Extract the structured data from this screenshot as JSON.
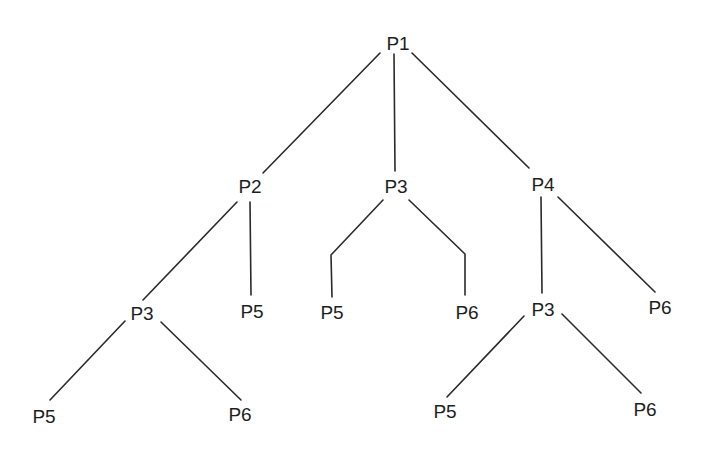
{
  "diagram": {
    "type": "tree",
    "background": "#ffffff",
    "line_color": "#2a2a2a",
    "text_color": "#1e1e1e",
    "nodes": [
      {
        "id": "n1",
        "label": "P1",
        "x": 398,
        "y": 50,
        "parent": null
      },
      {
        "id": "n2",
        "label": "P2",
        "x": 250,
        "y": 193,
        "parent": "n1"
      },
      {
        "id": "n3",
        "label": "P3",
        "x": 396,
        "y": 193,
        "parent": "n1"
      },
      {
        "id": "n4",
        "label": "P4",
        "x": 543,
        "y": 191,
        "parent": "n1"
      },
      {
        "id": "n5",
        "label": "P3",
        "x": 142,
        "y": 320,
        "parent": "n2"
      },
      {
        "id": "n6",
        "label": "P5",
        "x": 252,
        "y": 318,
        "parent": "n2"
      },
      {
        "id": "n7",
        "label": "P5",
        "x": 332,
        "y": 319,
        "parent": "n3"
      },
      {
        "id": "n8",
        "label": "P6",
        "x": 467,
        "y": 319,
        "parent": "n3"
      },
      {
        "id": "n9",
        "label": "P3",
        "x": 543,
        "y": 316,
        "parent": "n4"
      },
      {
        "id": "n10",
        "label": "P6",
        "x": 660,
        "y": 314,
        "parent": "n4"
      },
      {
        "id": "n11",
        "label": "P5",
        "x": 44,
        "y": 423,
        "parent": "n5"
      },
      {
        "id": "n12",
        "label": "P6",
        "x": 240,
        "y": 421,
        "parent": "n5"
      },
      {
        "id": "n13",
        "label": "P5",
        "x": 445,
        "y": 418,
        "parent": "n9"
      },
      {
        "id": "n14",
        "label": "P6",
        "x": 645,
        "y": 416,
        "parent": "n9"
      }
    ],
    "edges": [
      {
        "from": "n1",
        "to": "n2",
        "points": "380,53 263,173"
      },
      {
        "from": "n1",
        "to": "n3",
        "points": "394,54 395,171"
      },
      {
        "from": "n1",
        "to": "n4",
        "points": "412,53 529,168"
      },
      {
        "from": "n2",
        "to": "n5",
        "points": "237,202 143,300"
      },
      {
        "from": "n2",
        "to": "n6",
        "points": "250,202 251,295"
      },
      {
        "from": "n3",
        "to": "n7",
        "points": "383,200 331,255 332,297"
      },
      {
        "from": "n3",
        "to": "n8",
        "points": "409,200 465,254 465,295"
      },
      {
        "from": "n4",
        "to": "n9",
        "points": "541,197 542,293"
      },
      {
        "from": "n4",
        "to": "n10",
        "points": "558,197 655,292"
      },
      {
        "from": "n5",
        "to": "n11",
        "points": "125,321 50,400"
      },
      {
        "from": "n5",
        "to": "n12",
        "points": "161,322 241,400"
      },
      {
        "from": "n9",
        "to": "n13",
        "points": "524,316 447,397"
      },
      {
        "from": "n9",
        "to": "n14",
        "points": "562,314 641,393"
      }
    ]
  }
}
